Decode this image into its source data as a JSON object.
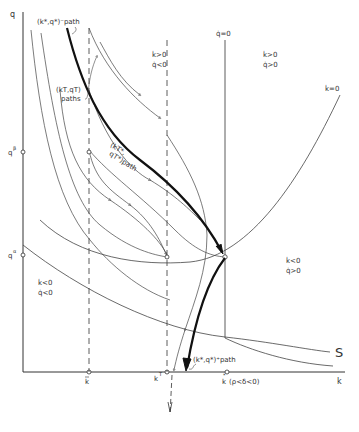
{
  "diagram": {
    "type": "phase-diagram",
    "axes": {
      "x_label": "k",
      "y_label": "q"
    },
    "y_ticks": [
      {
        "label": "qβ",
        "base": "q",
        "sup": "β"
      },
      {
        "label": "qα",
        "base": "q",
        "sup": "α"
      }
    ],
    "x_ticks": [
      {
        "label": "k̄",
        "base": "k",
        "mark": "bar"
      },
      {
        "label": "kT",
        "base": "k",
        "sup": "T"
      },
      {
        "label": "k*",
        "base": "k",
        "mark": "*",
        "note": "(ρ<δ<0)"
      }
    ],
    "loci": {
      "q_dot_zero": "q̇=0",
      "k_dot_zero": "k̇=0",
      "s_curve": "S"
    },
    "regions": [
      {
        "line1": "k̇>0",
        "line2": "q̇<0"
      },
      {
        "line1": "k̇>0",
        "line2": "q̇>0"
      },
      {
        "line1": "k̇<0",
        "line2": "q̇>0"
      },
      {
        "line1": "k̇<0",
        "line2": "q̇<0"
      }
    ],
    "path_labels": {
      "saddle_upper": "(k*,q*)⁻path",
      "kt_paths_line1": "(kT,qT)",
      "kt_paths_line2": "paths",
      "kt_star_line1": "(kT*,",
      "kt_star_line2": "qT*)path",
      "saddle_lower": "(k*,q*)⁺path"
    },
    "colors": {
      "ink": "#333333",
      "background": "#ffffff"
    }
  }
}
